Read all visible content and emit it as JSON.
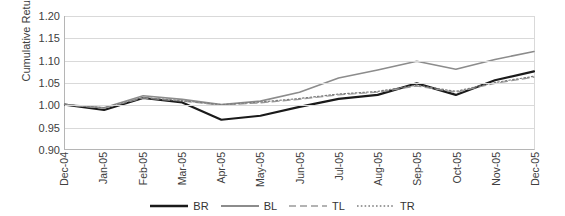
{
  "chart_data": {
    "type": "line",
    "title": "",
    "xlabel": "",
    "ylabel": "Cumulative Return",
    "ylim": [
      0.9,
      1.2
    ],
    "yticks": [
      "1.20",
      "1.15",
      "1.10",
      "1.05",
      "1.00",
      "0.95",
      "0.90"
    ],
    "ytick_values": [
      1.2,
      1.15,
      1.1,
      1.05,
      1.0,
      0.95,
      0.9
    ],
    "grid": true,
    "legend_position": "bottom",
    "categories": [
      "Dec-04",
      "Jan-05",
      "Feb-05",
      "Mar-05",
      "Apr-05",
      "May-05",
      "Jun-05",
      "Jul-05",
      "Aug-05",
      "Sep-05",
      "Oct-05",
      "Nov-05",
      "Dec-05"
    ],
    "series": [
      {
        "name": "BR",
        "color": "#1a1a1a",
        "width": 2.2,
        "dash": "none",
        "values": [
          1.0,
          0.988,
          1.015,
          1.005,
          0.966,
          0.975,
          0.995,
          1.013,
          1.022,
          1.048,
          1.022,
          1.055,
          1.075
        ]
      },
      {
        "name": "BL",
        "color": "#8c8c8c",
        "width": 1.6,
        "dash": "none",
        "values": [
          1.0,
          0.993,
          1.02,
          1.012,
          1.0,
          1.008,
          1.028,
          1.06,
          1.078,
          1.098,
          1.08,
          1.102,
          1.12
        ]
      },
      {
        "name": "TL",
        "color": "#9a9a9a",
        "width": 1.2,
        "dash": "7,4",
        "values": [
          1.0,
          0.992,
          1.015,
          1.008,
          0.999,
          1.004,
          1.012,
          1.022,
          1.028,
          1.042,
          1.028,
          1.048,
          1.062
        ]
      },
      {
        "name": "TR",
        "color": "#7d7d7d",
        "width": 1.2,
        "dash": "1.6,2.2",
        "values": [
          1.0,
          0.993,
          1.016,
          1.009,
          1.0,
          1.006,
          1.014,
          1.024,
          1.03,
          1.044,
          1.03,
          1.05,
          1.064
        ]
      }
    ]
  },
  "legend": {
    "items": [
      {
        "label": "BR",
        "color": "#1a1a1a",
        "width": 2.4,
        "dash": "none"
      },
      {
        "label": "BL",
        "color": "#8c8c8c",
        "width": 1.8,
        "dash": "none"
      },
      {
        "label": "TL",
        "color": "#9a9a9a",
        "width": 1.3,
        "dash": "7,4"
      },
      {
        "label": "TR",
        "color": "#7d7d7d",
        "width": 1.3,
        "dash": "1.6,2.2"
      }
    ]
  }
}
